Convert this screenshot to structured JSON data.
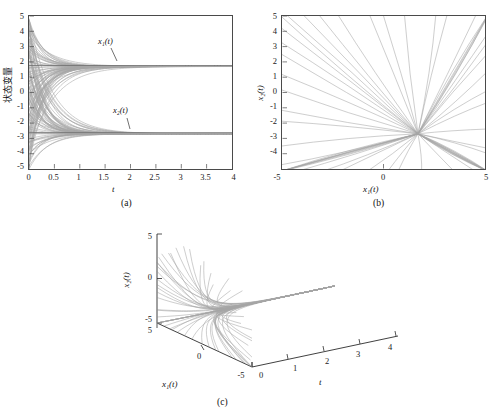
{
  "figure": {
    "panels": [
      {
        "caption": "(a)",
        "type": "line",
        "xlabel": "t",
        "ylabel": "状态变量",
        "ylabel_meaning": "state variables",
        "xlim": [
          0,
          4
        ],
        "ylim": [
          -5,
          5
        ],
        "xticks": [
          "0",
          "0.5",
          "1",
          "1.5",
          "2",
          "2.5",
          "3",
          "3.5",
          "4"
        ],
        "xtick_values": [
          0,
          0.5,
          1,
          1.5,
          2,
          2.5,
          3,
          3.5,
          4
        ],
        "yticks": [
          "5",
          "4",
          "3",
          "2",
          "1",
          "0",
          "-1",
          "-2",
          "-3",
          "-4",
          "-5"
        ],
        "ytick_values": [
          5,
          4,
          3,
          2,
          1,
          0,
          -1,
          -2,
          -3,
          -4,
          -5
        ],
        "annotations": [
          {
            "text": "x₁(t)",
            "x": 1.5,
            "y": 3.0
          },
          {
            "text": "x₂(t)",
            "x": 1.95,
            "y": -0.55
          }
        ],
        "series_count": 60,
        "converges_to": [
          1.7,
          -2.7
        ],
        "description": "Sixty trajectories of x1(t) fan out from scattered initial values on [-5,5] and converge; the x1 family settles at 1.7 and the x2 family settles at -2.7 by about t=2."
      },
      {
        "caption": "(b)",
        "type": "line",
        "xlabel": "x₁(t)",
        "ylabel": "x₂(t)",
        "xlim": [
          -5,
          5
        ],
        "ylim": [
          -5,
          5
        ],
        "xticks": [
          "-5",
          "0",
          "5"
        ],
        "xtick_values": [
          -5,
          0,
          5
        ],
        "yticks": [
          "5",
          "4",
          "3",
          "2",
          "1",
          "0",
          "-1",
          "-2",
          "-3",
          "-4",
          "-5"
        ],
        "ytick_values": [
          5,
          4,
          3,
          2,
          1,
          0,
          -1,
          -2,
          -3,
          -4,
          -5
        ],
        "series_count": 60,
        "converges_to": [
          1.7,
          -2.7
        ],
        "description": "Phase portrait: straight-line trajectories radiate inward from the boundary of the square and all terminate at the common equilibrium near (1.7, -2.7)."
      },
      {
        "caption": "(c)",
        "type": "line3d",
        "xlabel": "x₁(t)",
        "ylabel": "x₂(t)",
        "zlabel": "t",
        "x1lim": [
          -5,
          5
        ],
        "x2lim": [
          -5,
          5
        ],
        "tlim": [
          0,
          4
        ],
        "x1ticks": [
          "5",
          "0",
          "-5"
        ],
        "x2ticks": [
          "5",
          "0",
          "-5"
        ],
        "tticks": [
          "0",
          "1",
          "2",
          "3",
          "4"
        ],
        "ttick_values": [
          0,
          1,
          2,
          3,
          4
        ],
        "series_count": 60,
        "converges_to": [
          1.7,
          -2.7
        ],
        "description": "Three-dimensional view of the same ensemble plotted against time; the bundle collapses onto a single ridge running along the t axis."
      }
    ]
  },
  "chart_data": [
    {
      "type": "line",
      "panel": "(a)",
      "title": "",
      "xlabel": "t",
      "ylabel": "状态变量",
      "xlim": [
        0,
        4
      ],
      "ylim": [
        -5,
        5
      ],
      "grid": false,
      "legend": "none",
      "xticks": [
        0,
        0.5,
        1,
        1.5,
        2,
        2.5,
        3,
        3.5,
        4
      ],
      "yticks": [
        5,
        4,
        3,
        2,
        1,
        0,
        -1,
        -2,
        -3,
        -4,
        -5
      ],
      "annotations": [
        "x₁(t)",
        "x₂(t)"
      ],
      "series": [
        {
          "name": "x1(t) ensemble",
          "initial_range": [
            -5,
            5
          ],
          "limit": 1.7,
          "settling_time": 2.0,
          "count": 60
        },
        {
          "name": "x2(t) ensemble",
          "initial_range": [
            -5,
            5
          ],
          "limit": -2.7,
          "settling_time": 2.0,
          "count": 60
        }
      ]
    },
    {
      "type": "line",
      "panel": "(b)",
      "title": "",
      "xlabel": "x₁(t)",
      "ylabel": "x₂(t)",
      "xlim": [
        -5,
        5
      ],
      "ylim": [
        -5,
        5
      ],
      "grid": false,
      "legend": "none",
      "xticks": [
        -5,
        0,
        5
      ],
      "yticks": [
        5,
        4,
        3,
        2,
        1,
        0,
        -1,
        -2,
        -3,
        -4,
        -5
      ],
      "equilibrium": [
        1.7,
        -2.7
      ],
      "series": [
        {
          "name": "phase trajectories",
          "count": 60,
          "converges_to": [
            1.7,
            -2.7
          ]
        }
      ]
    },
    {
      "type": "line",
      "panel": "(c)",
      "title": "",
      "xlabel": "x₁(t)",
      "ylabel": "x₂(t)",
      "zlabel": "t",
      "grid": false,
      "legend": "none",
      "x1ticks": [
        5,
        0,
        -5
      ],
      "x2ticks": [
        5,
        0,
        -5
      ],
      "tticks": [
        0,
        1,
        2,
        3,
        4
      ],
      "equilibrium": [
        1.7,
        -2.7
      ],
      "series": [
        {
          "name": "3D trajectories",
          "count": 60,
          "converges_to": [
            1.7,
            -2.7
          ]
        }
      ]
    }
  ]
}
